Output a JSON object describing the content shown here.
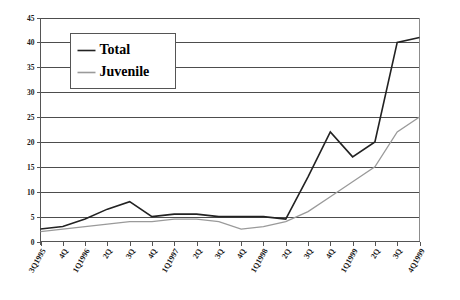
{
  "chart_data": {
    "type": "line",
    "title": "",
    "subtitle": "",
    "xlabel": "",
    "ylabel": "",
    "ylim": [
      0,
      45
    ],
    "ytick_step": 5,
    "yticks": [
      0,
      5,
      10,
      15,
      20,
      25,
      30,
      35,
      40,
      45
    ],
    "grid": true,
    "grid_axis": "y",
    "legend_position": "top-left",
    "categories": [
      "3Q1995",
      "4Q",
      "1Q1996",
      "2Q",
      "3Q",
      "4Q",
      "1Q1997",
      "2Q",
      "3Q",
      "4Q",
      "1Q1998",
      "2Q",
      "3Q",
      "4Q",
      "1Q1999",
      "2Q",
      "3Q",
      "4Q1999"
    ],
    "series": [
      {
        "name": "Total",
        "color": "#222222",
        "values": [
          2.5,
          3,
          4.5,
          6.5,
          8,
          5,
          5.5,
          5.5,
          5,
          5,
          5,
          4.5,
          13,
          22,
          17,
          20,
          40,
          41
        ]
      },
      {
        "name": "Juvenile",
        "color": "#9a9a9a",
        "values": [
          2,
          2.5,
          3,
          3.5,
          4,
          4,
          4.5,
          4.5,
          4,
          2.5,
          3,
          4,
          6,
          9,
          12,
          15,
          22,
          25
        ]
      }
    ]
  },
  "legend": {
    "entries": [
      {
        "label": "Total"
      },
      {
        "label": "Juvenile"
      }
    ]
  },
  "colors": {
    "total": "#222222",
    "juvenile": "#9a9a9a",
    "gridline": "#4d4d4d",
    "frame": "#8c8c8c",
    "background": "#ffffff"
  }
}
